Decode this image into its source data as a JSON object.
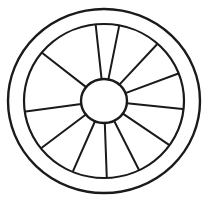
{
  "image": {
    "title": "Wheel line drawing",
    "subject": "wagon-wheel",
    "style": "hand-drawn black ink outline, uncolored",
    "background_color": "#ffffff",
    "line_color": "#1a1a1a",
    "width": 208,
    "height": 201
  },
  "geometry": {
    "center_x": 104,
    "center_y": 101,
    "outer_rim": {
      "name": "outer-rim-circle",
      "radius_x": 96,
      "radius_y": 92,
      "stroke_width": 2.4
    },
    "inner_rim": {
      "name": "inner-rim-circle",
      "radius_x": 80,
      "radius_y": 77,
      "stroke_width": 2.2
    },
    "hub": {
      "name": "hub-circle",
      "radius_x": 23,
      "radius_y": 22,
      "stroke_width": 2.4
    },
    "spoke_count": 12,
    "spoke_stroke_width": 2.0,
    "spokes": [
      {
        "label": "spoke-1",
        "angle_deg": -96,
        "inner_r": 23,
        "outer_r": 79
      },
      {
        "label": "spoke-2",
        "angle_deg": -79,
        "inner_r": 23,
        "outer_r": 79
      },
      {
        "label": "spoke-3",
        "angle_deg": -48,
        "inner_r": 23,
        "outer_r": 79
      },
      {
        "label": "spoke-4",
        "angle_deg": -21,
        "inner_r": 23,
        "outer_r": 79
      },
      {
        "label": "spoke-5",
        "angle_deg": 6,
        "inner_r": 23,
        "outer_r": 79
      },
      {
        "label": "spoke-6",
        "angle_deg": 35,
        "inner_r": 23,
        "outer_r": 79
      },
      {
        "label": "spoke-7",
        "angle_deg": 64,
        "inner_r": 23,
        "outer_r": 79
      },
      {
        "label": "spoke-8",
        "angle_deg": 88,
        "inner_r": 23,
        "outer_r": 79
      },
      {
        "label": "spoke-9",
        "angle_deg": 113,
        "inner_r": 23,
        "outer_r": 79
      },
      {
        "label": "spoke-10",
        "angle_deg": 142,
        "inner_r": 23,
        "outer_r": 79
      },
      {
        "label": "spoke-11",
        "angle_deg": 172,
        "inner_r": 23,
        "outer_r": 79
      },
      {
        "label": "spoke-12",
        "angle_deg": -141,
        "inner_r": 23,
        "outer_r": 79
      }
    ]
  }
}
